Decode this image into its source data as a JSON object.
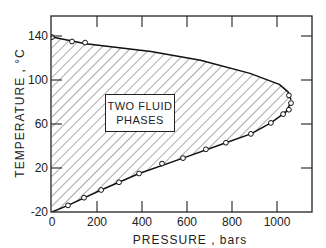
{
  "chart_data": {
    "type": "area",
    "title": "",
    "xlabel": "PRESSURE , bars",
    "ylabel": "TEMPERATURE , °C",
    "xlim": [
      0,
      1150
    ],
    "ylim": [
      -20,
      160
    ],
    "xticks": [
      0,
      200,
      400,
      600,
      800,
      1000
    ],
    "yticks": [
      -20,
      20,
      60,
      100,
      140
    ],
    "grid": false,
    "annotation": "TWO FLUID PHASES",
    "region_fill": "diagonal hatch",
    "series": [
      {
        "name": "upper boundary (measured)",
        "points": [
          [
            0,
            139
          ],
          [
            89,
            135
          ],
          [
            147,
            134
          ]
        ]
      },
      {
        "name": "upper boundary (curve)",
        "points": [
          [
            0,
            139
          ],
          [
            150,
            133
          ],
          [
            440,
            126
          ],
          [
            660,
            118
          ],
          [
            880,
            106
          ],
          [
            1010,
            96
          ],
          [
            1050,
            89
          ],
          [
            1062,
            82
          ]
        ]
      },
      {
        "name": "lower boundary (measured)",
        "points": [
          [
            71,
            -14
          ],
          [
            142,
            -7
          ],
          [
            218,
            0
          ],
          [
            298,
            7
          ],
          [
            387,
            15
          ],
          [
            489,
            24
          ],
          [
            582,
            29
          ],
          [
            684,
            37
          ],
          [
            773,
            43
          ],
          [
            884,
            51
          ],
          [
            973,
            61
          ],
          [
            1027,
            69
          ],
          [
            1053,
            73
          ],
          [
            1062,
            79
          ],
          [
            1053,
            86
          ]
        ]
      },
      {
        "name": "lower boundary (curve)",
        "points": [
          [
            0,
            -20
          ],
          [
            71,
            -14
          ],
          [
            218,
            0
          ],
          [
            387,
            15
          ],
          [
            582,
            29
          ],
          [
            773,
            43
          ],
          [
            884,
            51
          ],
          [
            973,
            61
          ],
          [
            1040,
            71
          ],
          [
            1062,
            80
          ]
        ]
      }
    ]
  },
  "axes": {
    "y_ticks": [
      "140",
      "100",
      "60",
      "20",
      "-20"
    ],
    "x_ticks": [
      "0",
      "200",
      "400",
      "600",
      "800",
      "1000"
    ],
    "xlabel": "PRESSURE ,  bars",
    "ylabel": "TEMPERATURE , °C"
  },
  "annotation": {
    "line1": "TWO FLUID",
    "line2": "PHASES"
  }
}
